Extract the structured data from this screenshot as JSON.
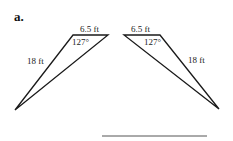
{
  "problem": {
    "part_label": "a.",
    "answer_line": true
  },
  "triangles": [
    {
      "id": "left",
      "top_side": "6.5 ft",
      "angle": "127°",
      "slant_side": "18 ft"
    },
    {
      "id": "right",
      "top_side": "6.5 ft",
      "angle": "127°",
      "slant_side": "18 ft"
    }
  ],
  "colors": {
    "stroke": "#1a1a1a",
    "answer_line": "#555555"
  }
}
